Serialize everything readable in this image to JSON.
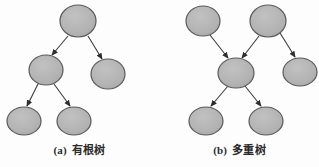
{
  "figure": {
    "background_color": "#fefefe",
    "node_fill": "#b4b4b4",
    "node_stroke": "#5a5a5a",
    "edge_color": "#3c3c3c",
    "caption_color": "#2b2b2b"
  },
  "panels": [
    {
      "id": "a",
      "caption_index": "(a)",
      "caption_label": "有根树",
      "diagram_type": "rooted-tree",
      "nodes": [
        {
          "id": "a-root",
          "name": "root-node",
          "cx": 78,
          "cy": 21,
          "rx": 18,
          "ry": 16
        },
        {
          "id": "a-left",
          "name": "left-child-node",
          "cx": 46,
          "cy": 70,
          "rx": 17,
          "ry": 15
        },
        {
          "id": "a-right",
          "name": "right-child-node",
          "cx": 108,
          "cy": 74,
          "rx": 17,
          "ry": 15
        },
        {
          "id": "a-leaf-left",
          "name": "left-leaf-node",
          "cx": 24,
          "cy": 121,
          "rx": 17,
          "ry": 14
        },
        {
          "id": "a-leaf-right",
          "name": "right-leaf-node",
          "cx": 74,
          "cy": 121,
          "rx": 17,
          "ry": 14
        }
      ],
      "edges": [
        {
          "name": "edge-root-to-left",
          "from": "a-root",
          "to": "a-left",
          "x1": 68,
          "y1": 36,
          "x2": 52,
          "y2": 55
        },
        {
          "name": "edge-root-to-right",
          "from": "a-root",
          "to": "a-right",
          "x1": 88,
          "y1": 36,
          "x2": 102,
          "y2": 59
        },
        {
          "name": "edge-left-to-leaf-left",
          "from": "a-left",
          "to": "a-leaf-left",
          "x1": 38,
          "y1": 84,
          "x2": 27,
          "y2": 106
        },
        {
          "name": "edge-left-to-leaf-right",
          "from": "a-left",
          "to": "a-leaf-right",
          "x1": 54,
          "y1": 84,
          "x2": 70,
          "y2": 106
        }
      ]
    },
    {
      "id": "b",
      "caption_index": "(b)",
      "caption_label": "多重树",
      "diagram_type": "multitree",
      "nodes": [
        {
          "id": "b-top-left",
          "name": "top-left-node",
          "cx": 43,
          "cy": 21,
          "rx": 17,
          "ry": 15
        },
        {
          "id": "b-top-right",
          "name": "top-right-node",
          "cx": 108,
          "cy": 21,
          "rx": 18,
          "ry": 16
        },
        {
          "id": "b-middle",
          "name": "middle-node",
          "cx": 76,
          "cy": 73,
          "rx": 18,
          "ry": 15
        },
        {
          "id": "b-side-right",
          "name": "right-side-node",
          "cx": 140,
          "cy": 72,
          "rx": 17,
          "ry": 14
        },
        {
          "id": "b-leaf-left",
          "name": "left-leaf-node",
          "cx": 46,
          "cy": 121,
          "rx": 17,
          "ry": 14
        },
        {
          "id": "b-leaf-right",
          "name": "right-leaf-node",
          "cx": 106,
          "cy": 121,
          "rx": 17,
          "ry": 14
        }
      ],
      "edges": [
        {
          "name": "edge-topleft-to-middle",
          "from": "b-top-left",
          "to": "b-middle",
          "x1": 50,
          "y1": 35,
          "x2": 68,
          "y2": 58
        },
        {
          "name": "edge-topright-to-middle",
          "from": "b-top-right",
          "to": "b-middle",
          "x1": 99,
          "y1": 36,
          "x2": 82,
          "y2": 58
        },
        {
          "name": "edge-topright-to-sideright",
          "from": "b-top-right",
          "to": "b-side-right",
          "x1": 120,
          "y1": 33,
          "x2": 135,
          "y2": 57
        },
        {
          "name": "edge-middle-to-leafleft",
          "from": "b-middle",
          "to": "b-leaf-left",
          "x1": 68,
          "y1": 86,
          "x2": 51,
          "y2": 106
        },
        {
          "name": "edge-middle-to-leafright",
          "from": "b-middle",
          "to": "b-leaf-right",
          "x1": 85,
          "y1": 86,
          "x2": 101,
          "y2": 106
        }
      ]
    }
  ]
}
